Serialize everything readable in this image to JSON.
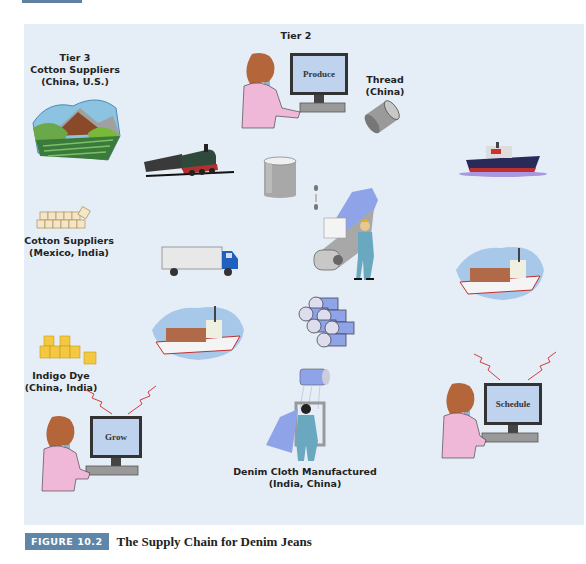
{
  "figure": {
    "badge": "FIGURE 10.2",
    "title": "The Supply Chain for Denim Jeans"
  },
  "nodes": {
    "tier3": {
      "line1": "Tier 3",
      "line2": "Cotton Suppliers",
      "line3": "(China, U.S.)"
    },
    "tier2": {
      "label": "Tier 2",
      "screen": "Produce"
    },
    "thread": {
      "line1": "Thread",
      "line2": "(China)"
    },
    "cotton_suppliers": {
      "line1": "Cotton Suppliers",
      "line2": "(Mexico, India)"
    },
    "indigo_dye": {
      "line1": "Indigo Dye",
      "line2": "(China, India)"
    },
    "grow": {
      "screen": "Grow"
    },
    "schedule": {
      "screen": "Schedule"
    },
    "denim_cloth": {
      "line1": "Denim Cloth Manufactured",
      "line2": "(India, China)"
    }
  },
  "icons": [
    "farm-landscape-icon",
    "computer-operator-icon",
    "thread-spool-icon",
    "train-icon",
    "yarn-canister-icon",
    "cargo-ship-icon",
    "cotton-bales-icon",
    "spinning-machine-worker-icon",
    "truck-icon",
    "container-ship-icon",
    "fabric-rolls-icon",
    "dye-barrels-icon",
    "loom-worker-icon",
    "wireless-signal-icon"
  ],
  "colors": {
    "panel": "#e5eef6",
    "badge": "#5f86a8",
    "denim": "#8fa4e8",
    "skin_shirt": "#f0b8d8",
    "hair": "#b5653a",
    "signal": "#d04040"
  }
}
